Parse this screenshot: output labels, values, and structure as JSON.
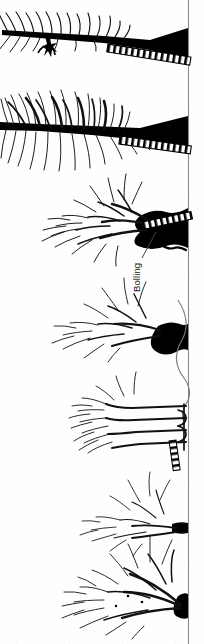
{
  "figure": {
    "orientation": "rotated-90-ccw",
    "width_px": 204,
    "height_px": 644,
    "background_color": "#fefefe",
    "ink_color": "#000000",
    "axis": {
      "name": "vertical-baseline-axis",
      "x_px": 188,
      "y_start_px": 0,
      "y_end_px": 644,
      "color": "#7a7a7a",
      "stroke_width_px": 1.1
    },
    "labels": [
      {
        "id": "bolling",
        "text": "Bolling",
        "rotation_deg": -90,
        "x_px": 140,
        "y_px": 292,
        "leader_line": {
          "from_x_px": 142,
          "from_y_px": 258,
          "to_x_px": 156,
          "to_y_px": 232
        }
      }
    ],
    "figures": [
      {
        "id": "hanging-figure-glyph",
        "kind": "silhouette",
        "x_px": 44,
        "y_px": 44,
        "description": "small dark human-like silhouette suspended below the upper branch"
      }
    ],
    "fans": [
      {
        "id": "fan-1",
        "order": 1,
        "baseline_y_px": 30,
        "tip_x_px": 0,
        "root_x_px": 188,
        "density": "sparse-feathered",
        "trunk_weight": "heavy",
        "spread_px": 34
      },
      {
        "id": "fan-2",
        "order": 2,
        "baseline_y_px": 128,
        "tip_x_px": 0,
        "root_x_px": 188,
        "density": "dense-bushy",
        "trunk_weight": "heavy",
        "spread_px": 78
      },
      {
        "id": "fan-3",
        "order": 3,
        "baseline_y_px": 228,
        "tip_x_px": 58,
        "root_x_px": 188,
        "density": "medium-branched",
        "trunk_weight": "heavy-blob",
        "spread_px": 62
      },
      {
        "id": "fan-4",
        "order": 4,
        "baseline_y_px": 336,
        "tip_x_px": 72,
        "root_x_px": 186,
        "density": "medium-light",
        "trunk_weight": "medium",
        "spread_px": 48
      },
      {
        "id": "fan-5",
        "order": 5,
        "baseline_y_px": 428,
        "tip_x_px": 78,
        "root_x_px": 188,
        "density": "banded-parallel",
        "trunk_weight": "thin-parallel",
        "spread_px": 42
      },
      {
        "id": "fan-6",
        "order": 6,
        "baseline_y_px": 524,
        "tip_x_px": 100,
        "root_x_px": 188,
        "density": "light-sparse",
        "trunk_weight": "thin",
        "spread_px": 34
      },
      {
        "id": "fan-7",
        "order": 7,
        "baseline_y_px": 606,
        "tip_x_px": 66,
        "root_x_px": 188,
        "density": "dense-plume",
        "trunk_weight": "medium-heavy",
        "spread_px": 46
      }
    ],
    "hatched_bands": [
      {
        "id": "band-1",
        "order": 1,
        "start_x_px": 108,
        "start_y_px": 42,
        "end_x_px": 188,
        "end_y_px": 56,
        "rung_count": 26,
        "style": "ladder-hatched"
      },
      {
        "id": "band-2",
        "order": 2,
        "start_x_px": 120,
        "start_y_px": 134,
        "end_x_px": 188,
        "end_y_px": 146,
        "rung_count": 24,
        "style": "ladder-hatched"
      },
      {
        "id": "band-3",
        "order": 3,
        "start_x_px": 142,
        "start_y_px": 222,
        "end_x_px": 188,
        "end_y_px": 212,
        "rung_count": 16,
        "style": "ladder-hatched"
      },
      {
        "id": "band-4",
        "order": 4,
        "start_x_px": 176,
        "start_y_px": 438,
        "end_x_px": 184,
        "end_y_px": 468,
        "rung_count": 10,
        "style": "ladder-hatched-vertical"
      }
    ],
    "curve": {
      "id": "sigmoid-curve",
      "description": "thin wavy curve running down the right margin between fan-4 and fan-5",
      "start_y_px": 300,
      "end_y_px": 420,
      "color": "#6e6e6e"
    }
  }
}
